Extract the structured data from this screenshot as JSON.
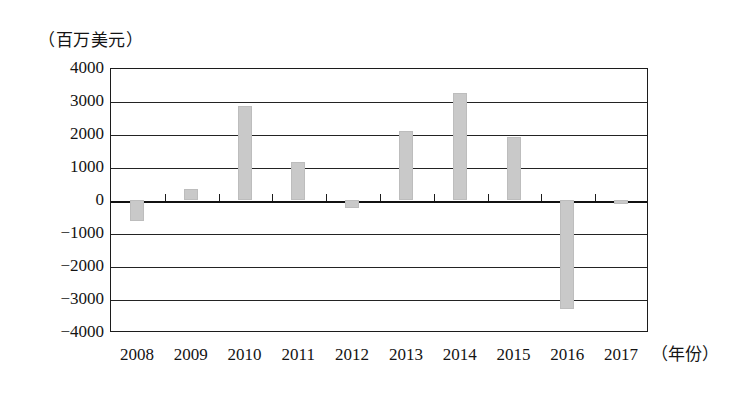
{
  "chart_data": {
    "type": "bar",
    "title": "",
    "subtitle": "",
    "unit_caption": "（百万美元）",
    "xlabel": "（年份）",
    "ylabel": "",
    "categories": [
      "2008",
      "2009",
      "2010",
      "2011",
      "2012",
      "2013",
      "2014",
      "2015",
      "2016",
      "2017"
    ],
    "values": [
      -620,
      330,
      2850,
      1150,
      -240,
      2080,
      3250,
      1900,
      -3300,
      -110
    ],
    "ylim": [
      -4000,
      4000
    ],
    "ytick_labels": [
      "4000",
      "3000",
      "2000",
      "1000",
      "0",
      "−1000",
      "−2000",
      "−3000",
      "−4000"
    ],
    "ytick_values": [
      4000,
      3000,
      2000,
      1000,
      0,
      -1000,
      -2000,
      -3000,
      -4000
    ],
    "grid": true,
    "legend": "none",
    "bar_color": "#c9c9c9",
    "axis_color": "#1c1c1c",
    "background_color": "#ffffff"
  }
}
